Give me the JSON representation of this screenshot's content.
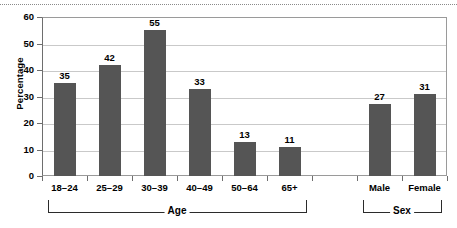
{
  "chart_data": {
    "type": "bar",
    "title": "",
    "subtitle": "",
    "xlabel": "",
    "ylabel": "Percentage",
    "ylim": [
      0,
      60
    ],
    "yticks": [
      0,
      10,
      20,
      30,
      40,
      50,
      60
    ],
    "grid": true,
    "legend": null,
    "categories": [
      "18–24",
      "25–29",
      "30–39",
      "40–49",
      "50–64",
      "65+",
      "Male",
      "Female"
    ],
    "values": [
      35,
      42,
      55,
      33,
      13,
      11,
      27,
      31
    ],
    "bar_color": "#555555",
    "groups": [
      {
        "label": "Age",
        "categories": [
          "18–24",
          "25–29",
          "30–39",
          "40–49",
          "50–64",
          "65+"
        ]
      },
      {
        "label": "Sex",
        "categories": [
          "Male",
          "Female"
        ]
      }
    ],
    "annotations": [
      {
        "category": "18–24",
        "text": "35"
      },
      {
        "category": "25–29",
        "text": "42"
      },
      {
        "category": "30–39",
        "text": "55"
      },
      {
        "category": "40–49",
        "text": "33"
      },
      {
        "category": "50–64",
        "text": "13"
      },
      {
        "category": "65+",
        "text": "11"
      },
      {
        "category": "Male",
        "text": "27"
      },
      {
        "category": "Female",
        "text": "31"
      }
    ]
  }
}
